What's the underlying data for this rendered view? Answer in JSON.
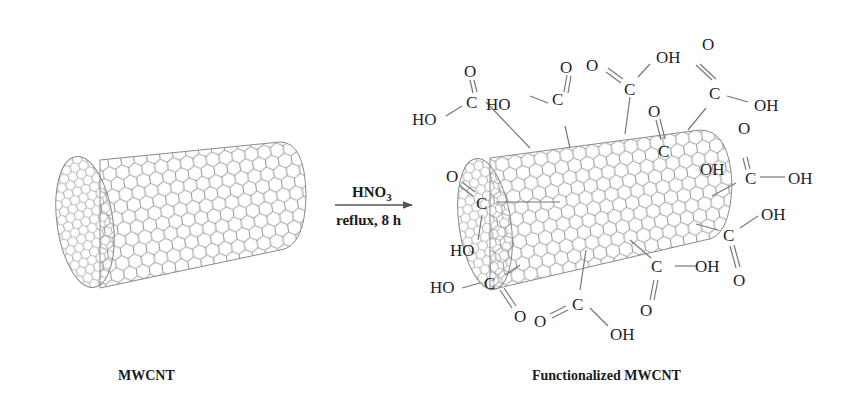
{
  "reaction": {
    "reagent": "HNO",
    "reagent_subscript": "3",
    "conditions": "reflux, 8 h"
  },
  "labels": {
    "reactant": "MWCNT",
    "product": "Functionalized MWCNT"
  },
  "atoms": {
    "C": "C",
    "O": "O",
    "OH": "OH",
    "HO": "HO"
  },
  "colors": {
    "lattice": "#8a8a8a",
    "text": "#1a1a1a",
    "arrow": "#555555"
  }
}
